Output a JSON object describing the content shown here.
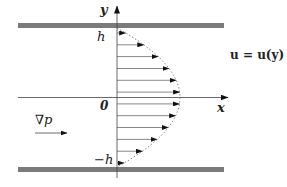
{
  "diagram": {
    "labels": {
      "y_axis": "y",
      "x_axis": "x",
      "origin": "0",
      "top_wall": "h",
      "bottom_wall": "−h",
      "pressure_gradient": "∇p",
      "velocity_equation": "u = u(y) x̂"
    },
    "colors": {
      "plate": "#7a7a7a",
      "axis": "#333333",
      "arrow": "#555555",
      "profile": "#666666"
    },
    "geometry": {
      "plate_left": 18,
      "plate_right": 224,
      "top_plate_y": 25.5,
      "bottom_plate_y": 169.5,
      "axis_x": 117,
      "mid_y": 97.5,
      "max_velocity_length": 63,
      "arrow_count": 12
    }
  }
}
